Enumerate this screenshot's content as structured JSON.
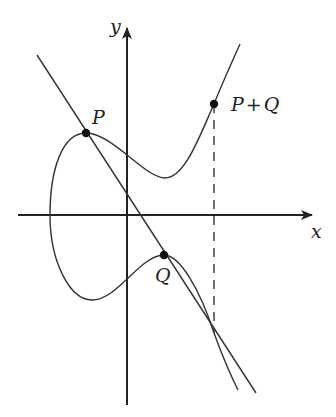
{
  "diagram": {
    "axes": {
      "x_label": "x",
      "y_label": "y"
    },
    "points": {
      "p_label": "P",
      "q_label": "Q",
      "sum_label": "P+Q",
      "sum_label_left": "P",
      "sum_label_plus": "+",
      "sum_label_right": "Q"
    },
    "colors": {
      "stroke": "#333333",
      "point": "#111111",
      "background": "#ffffff"
    }
  }
}
